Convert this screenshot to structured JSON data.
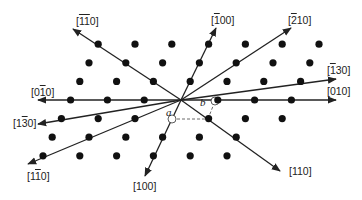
{
  "diagram": {
    "type": "hexagonal lattice directions",
    "origin": [
      181,
      100
    ],
    "lattice_vector_a": [
      -9.2,
      18.6
    ],
    "lattice_vector_b": [
      36.8,
      0
    ],
    "dot_color": "#111111",
    "line_color": "#222222",
    "basis_labels": {
      "a": "a",
      "b": "b"
    },
    "dots": {
      "rows": [
        {
          "i": -3,
          "j": [
            -3,
            -2,
            -1,
            0,
            1,
            2,
            3
          ]
        },
        {
          "i": -2,
          "j": [
            -3,
            -2,
            -1,
            0,
            1,
            2,
            3
          ]
        },
        {
          "i": -1,
          "j": [
            -3,
            -2,
            -1,
            0,
            1,
            2,
            3
          ]
        },
        {
          "i": 0,
          "j": [
            -3,
            -2,
            -1,
            1,
            2,
            3
          ]
        },
        {
          "i": 1,
          "j": [
            -3,
            -2,
            -1,
            1,
            2,
            3
          ]
        },
        {
          "i": 2,
          "j": [
            -3,
            -2,
            -1,
            0,
            1,
            2
          ]
        },
        {
          "i": 3,
          "j": [
            -3,
            -2,
            -1,
            0,
            1,
            2
          ]
        }
      ]
    },
    "directions": [
      {
        "id": "m1m10",
        "parts": [
          {
            "t": "1",
            "bar": true
          },
          {
            "t": "1",
            "bar": true
          },
          {
            "t": "0",
            "bar": false
          }
        ],
        "end": [
          73,
          29
        ],
        "label_pos": [
          76,
          15
        ]
      },
      {
        "id": "m100",
        "parts": [
          {
            "t": "1",
            "bar": true
          },
          {
            "t": "00",
            "bar": false
          }
        ],
        "end": [
          216,
          28
        ],
        "label_pos": [
          211,
          14
        ]
      },
      {
        "id": "m210",
        "parts": [
          {
            "t": "2",
            "bar": true
          },
          {
            "t": "10",
            "bar": false
          }
        ],
        "end": [
          291,
          28
        ],
        "label_pos": [
          288,
          14
        ]
      },
      {
        "id": "m130",
        "parts": [
          {
            "t": "1",
            "bar": true
          },
          {
            "t": "30",
            "bar": false
          }
        ],
        "end": [
          336,
          79
        ],
        "label_pos": [
          327,
          64
        ]
      },
      {
        "id": "010",
        "parts": [
          {
            "t": "010",
            "bar": false
          }
        ],
        "end": [
          336,
          100
        ],
        "label_pos": [
          327,
          85
        ]
      },
      {
        "id": "110",
        "parts": [
          {
            "t": "110",
            "bar": false
          }
        ],
        "end": [
          280,
          171
        ],
        "label_pos": [
          289,
          165
        ]
      },
      {
        "id": "100",
        "parts": [
          {
            "t": "100",
            "bar": false
          }
        ],
        "end": [
          145,
          176
        ],
        "label_pos": [
          133,
          180
        ]
      },
      {
        "id": "1m10",
        "parts": [
          {
            "t": "1",
            "bar": false
          },
          {
            "t": "1",
            "bar": true
          },
          {
            "t": "0",
            "bar": false
          }
        ],
        "end": [
          28,
          164
        ],
        "label_pos": [
          27,
          170
        ]
      },
      {
        "id": "1m30",
        "parts": [
          {
            "t": "1",
            "bar": false
          },
          {
            "t": "3",
            "bar": true
          },
          {
            "t": "0",
            "bar": false
          }
        ],
        "end": [
          38,
          124
        ],
        "label_pos": [
          13,
          117
        ]
      },
      {
        "id": "0m10",
        "parts": [
          {
            "t": "0",
            "bar": false
          },
          {
            "t": "1",
            "bar": true
          },
          {
            "t": "0",
            "bar": false
          }
        ],
        "end": [
          38,
          100
        ],
        "label_pos": [
          31,
          86
        ]
      }
    ],
    "unit_cell": {
      "open_circles": [
        [
          172,
          119
        ],
        [
          215,
          101
        ]
      ],
      "dashed_bottom": [
        [
          172,
          119
        ],
        [
          208,
          119
        ]
      ],
      "dashed_side": [
        [
          208,
          119
        ],
        [
          215,
          101
        ]
      ],
      "a_label_pos": [
        166,
        106
      ],
      "b_label_pos": [
        200,
        96
      ]
    }
  }
}
